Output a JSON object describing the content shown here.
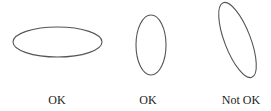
{
  "diagram": {
    "stroke_color": "#555555",
    "items": [
      {
        "id": "wide-ellipse",
        "label": "OK",
        "shape": {
          "cx": 57.5,
          "cy": 42,
          "rx": 44.5,
          "ry": 15,
          "rotate": 0
        },
        "label_x": 57
      },
      {
        "id": "tall-ellipse",
        "label": "OK",
        "shape": {
          "cx": 151,
          "cy": 45,
          "rx": 15,
          "ry": 30,
          "rotate": 0
        },
        "label_x": 148
      },
      {
        "id": "tilted-ellipse",
        "label": "Not OK",
        "shape": {
          "cx": 237.5,
          "cy": 40,
          "rx": 13,
          "ry": 40,
          "rotate": -21
        },
        "label_x": 241
      }
    ]
  }
}
